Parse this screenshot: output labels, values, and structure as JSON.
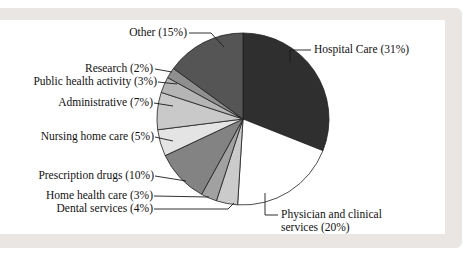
{
  "frame": {
    "background": "#ffffff",
    "panel_color": "#e9e6e4",
    "inner_color": "#ffffff"
  },
  "chart_data": {
    "type": "pie",
    "direction": "clockwise",
    "start_angle_deg": 0,
    "legend": "none",
    "label_style": "external-leader-lines",
    "center": {
      "x": 243,
      "y": 119,
      "r": 86
    },
    "outline_color": "#1f1f1f",
    "categories": [
      "Hospital Care",
      "Physician and clinical services",
      "Dental services",
      "Home health care",
      "Prescription drugs",
      "Nursing home care",
      "Administrative",
      "Public health activity",
      "Research",
      "Other"
    ],
    "values": [
      31,
      20,
      4,
      3,
      10,
      5,
      7,
      3,
      2,
      15
    ],
    "slices": [
      {
        "category": "Hospital Care",
        "value": 31,
        "color": "#2f2f2f",
        "label": "Hospital Care (31%)"
      },
      {
        "category": "Physician and clinical services",
        "value": 20,
        "color": "#ffffff",
        "label": "Physician and clinical services (20%)"
      },
      {
        "category": "Dental services",
        "value": 4,
        "color": "#cbcbcb",
        "label": "Dental services (4%)"
      },
      {
        "category": "Home health care",
        "value": 3,
        "color": "#a1a1a1",
        "label": "Home health care (3%)"
      },
      {
        "category": "Prescription drugs",
        "value": 10,
        "color": "#838383",
        "label": "Prescription drugs (10%)"
      },
      {
        "category": "Nursing home care",
        "value": 5,
        "color": "#e4e4e4",
        "label": "Nursing home care (5%)"
      },
      {
        "category": "Administrative",
        "value": 7,
        "color": "#c9c9c9",
        "label": "Administrative (7%)"
      },
      {
        "category": "Public health activity",
        "value": 3,
        "color": "#b5b5b5",
        "label": "Public health activity (3%)"
      },
      {
        "category": "Research",
        "value": 2,
        "color": "#8f8f8f",
        "label": "Research (2%)"
      },
      {
        "category": "Other",
        "value": 15,
        "color": "#555555",
        "label": "Other (15%)"
      }
    ],
    "leader_lines": [
      {
        "slice": "Hospital Care",
        "points": [
          [
            311,
            50
          ],
          [
            290,
            50
          ],
          [
            290,
            62
          ]
        ]
      },
      {
        "slice": "Physician and clinical services",
        "points": [
          [
            278,
            215
          ],
          [
            265,
            215
          ],
          [
            265,
            193
          ]
        ]
      },
      {
        "slice": "Dental services",
        "points": [
          [
            154,
            209
          ],
          [
            228,
            209
          ],
          [
            234,
            203
          ]
        ]
      },
      {
        "slice": "Home health care",
        "points": [
          [
            154,
            196
          ],
          [
            209,
            197
          ]
        ]
      },
      {
        "slice": "Prescription drugs",
        "points": [
          [
            155,
            176
          ],
          [
            186,
            181
          ]
        ]
      },
      {
        "slice": "Nursing home care",
        "points": [
          [
            155,
            137
          ],
          [
            173,
            141
          ]
        ]
      },
      {
        "slice": "Administrative",
        "points": [
          [
            154,
            103
          ],
          [
            173,
            106
          ]
        ]
      },
      {
        "slice": "Public health activity",
        "points": [
          [
            158,
            82
          ],
          [
            177,
            84
          ]
        ]
      },
      {
        "slice": "Research",
        "points": [
          [
            155,
            69
          ],
          [
            172,
            72
          ]
        ]
      },
      {
        "slice": "Other",
        "points": [
          [
            189,
            33
          ],
          [
            211,
            33
          ],
          [
            224,
            47
          ]
        ]
      }
    ]
  }
}
